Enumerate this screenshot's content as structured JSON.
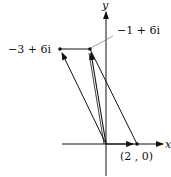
{
  "diagram": {
    "type": "complex-plane-vector-addition",
    "axes": {
      "x_label": "x",
      "y_label": "y"
    },
    "points": [
      {
        "id": "a",
        "label": "(2 , 0)",
        "re": 2,
        "im": 0
      },
      {
        "id": "b",
        "label": "−1 + 6i",
        "re": -1,
        "im": 6
      },
      {
        "id": "c",
        "label": "−3 + 6i",
        "re": -3,
        "im": 6
      }
    ],
    "vectors": [
      {
        "from": "origin",
        "to": "(2 , 0)"
      },
      {
        "from": "origin",
        "to": "−1 + 6i"
      },
      {
        "from": "origin",
        "to": "−3 + 6i"
      }
    ],
    "colors": {
      "stroke": "#111111",
      "leader": "#888888"
    }
  }
}
